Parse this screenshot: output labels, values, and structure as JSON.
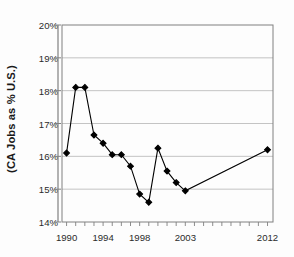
{
  "chart_data": {
    "type": "line",
    "title": "",
    "xlabel": "",
    "ylabel": "(CA Jobs as % U.S.)",
    "ylim": [
      14,
      20
    ],
    "xlim": [
      1989.5,
      2012.6
    ],
    "ytick_labels": [
      "14%",
      "15%",
      "16%",
      "17%",
      "18%",
      "19%",
      "20%"
    ],
    "ytick_values": [
      14,
      15,
      16,
      17,
      18,
      19,
      20
    ],
    "xtick_labels": [
      "1990",
      "1994",
      "1998",
      "2003",
      "2012"
    ],
    "xtick_values": [
      1990,
      1994,
      1998,
      2003,
      2012
    ],
    "grid": "horizontal",
    "legend": "none",
    "marker": "diamond",
    "marker_color": "#000000",
    "line_color": "#000000",
    "x": [
      1990,
      1991,
      1992,
      1993,
      1994,
      1995,
      1996,
      1997,
      1998,
      1999,
      2000,
      2001,
      2002,
      2003,
      2012
    ],
    "values": [
      16.1,
      18.1,
      18.1,
      16.65,
      16.4,
      16.05,
      16.05,
      15.7,
      14.85,
      14.6,
      16.25,
      15.55,
      15.2,
      14.95,
      16.2
    ],
    "points": [
      {
        "x": 1990,
        "y": 16.1
      },
      {
        "x": 1991,
        "y": 18.1
      },
      {
        "x": 1992,
        "y": 18.1
      },
      {
        "x": 1993,
        "y": 16.65
      },
      {
        "x": 1994,
        "y": 16.4
      },
      {
        "x": 1995,
        "y": 16.05
      },
      {
        "x": 1996,
        "y": 16.05
      },
      {
        "x": 1997,
        "y": 15.7
      },
      {
        "x": 1998,
        "y": 14.85
      },
      {
        "x": 1999,
        "y": 14.6
      },
      {
        "x": 2000,
        "y": 16.25
      },
      {
        "x": 2001,
        "y": 15.55
      },
      {
        "x": 2002,
        "y": 15.2
      },
      {
        "x": 2003,
        "y": 14.95
      },
      {
        "x": 2012,
        "y": 16.2
      }
    ]
  },
  "style": {
    "axis_color": "#808080",
    "grid_color": "#b5b5b5",
    "plot_bg": "#ffffff",
    "text_color": "#2b2b2b"
  },
  "geometry": {
    "plot_left": 62,
    "plot_right": 273,
    "plot_top": 25,
    "plot_bottom": 222
  }
}
